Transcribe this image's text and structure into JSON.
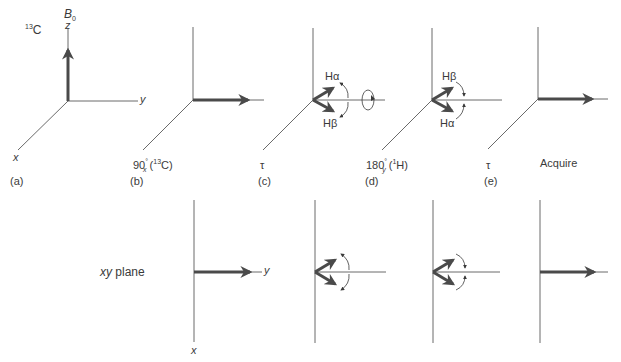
{
  "figure": {
    "colors": {
      "axis": "#6a6a6a",
      "vector": "#4a4a4a",
      "text": "#3a3a3a",
      "background": "#ffffff"
    },
    "top_row": {
      "nucleus_label": {
        "main": "C",
        "superscript": "13"
      },
      "field_label": {
        "main": "B",
        "subscript": "0"
      },
      "axis_labels": {
        "z": "z",
        "y": "y",
        "x": "x"
      },
      "panels": [
        {
          "id": "a",
          "panel_label": "(a)",
          "step_label": "",
          "vector": "along +z"
        },
        {
          "id": "b",
          "panel_label": "(b)",
          "step_label": {
            "main": "90",
            "deg": "°",
            "axis": "x",
            "nucleus_sup": "13",
            "nucleus": "C"
          },
          "vector": "along +y"
        },
        {
          "id": "c",
          "panel_label": "(c)",
          "step_label": "τ",
          "vector": "Hα and Hβ components diverge",
          "component_labels": {
            "upper": "Hα",
            "lower": "Hβ"
          }
        },
        {
          "id": "d",
          "panel_label": "(d)",
          "step_label": {
            "main": "180",
            "deg": "°",
            "axis": "y",
            "nucleus_sup": "1",
            "nucleus": "H"
          },
          "vector": "components swapped",
          "component_labels": {
            "upper": "Hβ",
            "lower": "Hα"
          }
        },
        {
          "id": "e",
          "panel_label": "(e)",
          "step_label": "τ",
          "vector": "refocused along +y"
        },
        {
          "id": "f",
          "panel_label": "",
          "step_label": "Acquire",
          "vector": "along +y"
        }
      ]
    },
    "bottom_row": {
      "title": {
        "italic": "xy",
        "text": " plane"
      },
      "axis_labels": {
        "y": "y",
        "x": "x"
      },
      "panels": [
        {
          "id": "b",
          "vector": "along +y"
        },
        {
          "id": "c",
          "vector": "two components diverging"
        },
        {
          "id": "d",
          "vector": "two components converging"
        },
        {
          "id": "e",
          "vector": "along +y"
        }
      ]
    }
  }
}
